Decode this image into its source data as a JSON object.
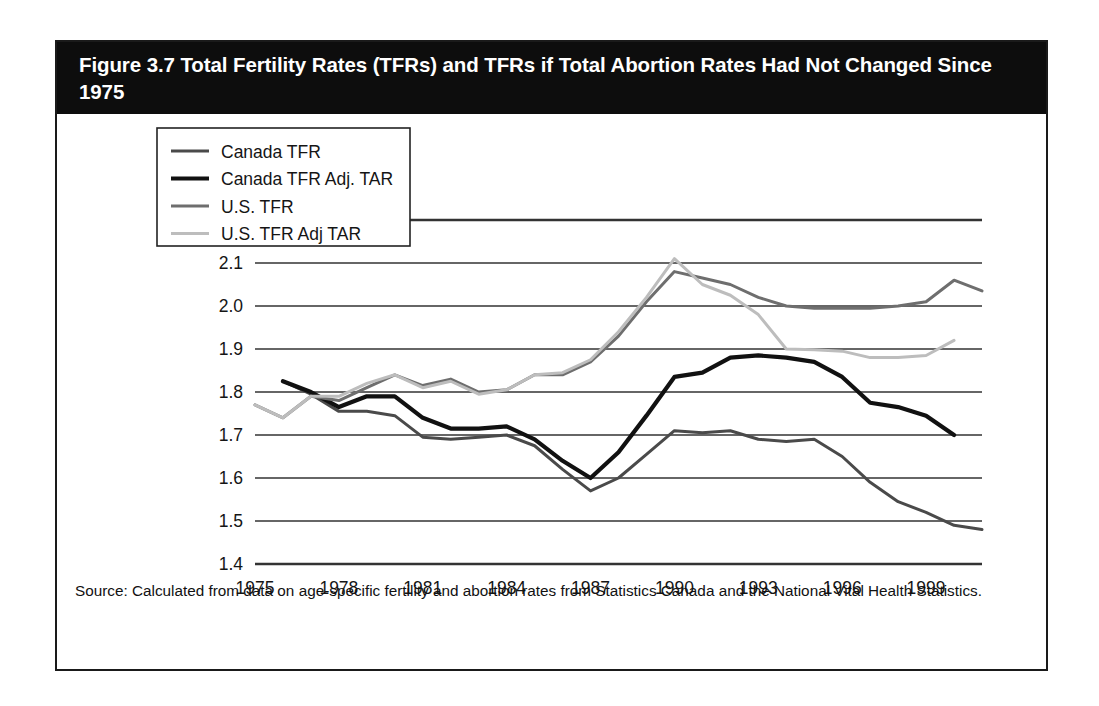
{
  "figure": {
    "title": "Figure 3.7 Total Fertility Rates (TFRs) and TFRs if Total Abortion Rates Had Not Changed Since 1975",
    "source": "Source: Calculated from data on age-specific fertility and abortion rates from Statistics Canada and the National Vital Health Statistics."
  },
  "colors": {
    "title_band": "#0d0d0d",
    "title_text": "#ffffff",
    "frame": "#1a1a1a",
    "gridline": "#333333",
    "axis": "#111111",
    "canada_tfr": "#4a4a4a",
    "canada_tfr_adj_tar": "#111111",
    "us_tfr": "#6e6e6e",
    "us_tfr_adj_tar": "#bdbdbd"
  },
  "chart_data": {
    "type": "line",
    "title": "Figure 3.7 Total Fertility Rates (TFRs) and TFRs if Total Abortion Rates Had Not Changed Since 1975",
    "xlabel": "",
    "ylabel": "",
    "xlim": [
      1975,
      2001
    ],
    "ylim": [
      1.4,
      2.2
    ],
    "yticks": [
      "1.4",
      "1.5",
      "1.6",
      "1.7",
      "1.8",
      "1.9",
      "2.0",
      "2.1",
      "2.2"
    ],
    "xticks": [
      "1975",
      "1978",
      "1981",
      "1984",
      "1987",
      "1990",
      "1993",
      "1996",
      "1999"
    ],
    "grid": true,
    "legend_position": "upper-left-inside",
    "x": [
      1975,
      1976,
      1977,
      1978,
      1979,
      1980,
      1981,
      1982,
      1983,
      1984,
      1985,
      1986,
      1987,
      1988,
      1989,
      1990,
      1991,
      1992,
      1993,
      1994,
      1995,
      1996,
      1997,
      1998,
      1999,
      2000,
      2001
    ],
    "series": [
      {
        "name": "Canada TFR",
        "color": "#4a4a4a",
        "width": 3.0,
        "values": [
          null,
          1.825,
          1.795,
          1.755,
          1.755,
          1.745,
          1.695,
          1.69,
          1.695,
          1.7,
          1.675,
          1.62,
          1.57,
          1.6,
          1.655,
          1.71,
          1.705,
          1.71,
          1.69,
          1.685,
          1.69,
          1.65,
          1.59,
          1.545,
          1.52,
          1.49,
          1.48
        ]
      },
      {
        "name": "Canada TFR Adj. TAR",
        "color": "#111111",
        "width": 4.2,
        "values": [
          null,
          1.825,
          1.8,
          1.765,
          1.79,
          1.79,
          1.74,
          1.715,
          1.715,
          1.72,
          1.69,
          1.64,
          1.6,
          1.66,
          1.745,
          1.835,
          1.845,
          1.88,
          1.885,
          1.88,
          1.87,
          1.835,
          1.775,
          1.765,
          1.745,
          1.7,
          null
        ]
      },
      {
        "name": "U.S. TFR",
        "color": "#6e6e6e",
        "width": 3.0,
        "values": [
          1.77,
          1.74,
          1.79,
          1.78,
          1.81,
          1.84,
          1.815,
          1.83,
          1.8,
          1.805,
          1.84,
          1.84,
          1.87,
          1.93,
          2.01,
          2.08,
          2.065,
          2.05,
          2.02,
          2.0,
          1.995,
          1.995,
          1.995,
          2.0,
          2.01,
          2.06,
          2.035
        ]
      },
      {
        "name": "U.S. TFR Adj TAR",
        "color": "#bdbdbd",
        "width": 3.0,
        "values": [
          1.77,
          1.74,
          1.79,
          1.79,
          1.82,
          1.84,
          1.81,
          1.825,
          1.795,
          1.805,
          1.84,
          1.845,
          1.875,
          1.94,
          2.02,
          2.11,
          2.05,
          2.025,
          1.98,
          1.9,
          1.898,
          1.895,
          1.88,
          1.88,
          1.885,
          1.92,
          null
        ]
      }
    ]
  },
  "legend": {
    "items": [
      {
        "label": "Canada TFR",
        "color": "#4a4a4a",
        "width": 3.0
      },
      {
        "label": "Canada TFR Adj. TAR",
        "color": "#111111",
        "width": 4.2
      },
      {
        "label": "U.S. TFR",
        "color": "#6e6e6e",
        "width": 3.0
      },
      {
        "label": "U.S. TFR Adj TAR",
        "color": "#bdbdbd",
        "width": 3.0
      }
    ]
  }
}
